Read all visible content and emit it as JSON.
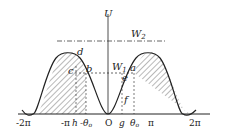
{
  "diagram": {
    "type": "potential-energy-curve",
    "axis": {
      "y_label": "U",
      "origin_label": "O"
    },
    "energy_levels": [
      {
        "name": "W2",
        "label": "W",
        "subscript": "2",
        "style": "dash-dot"
      },
      {
        "name": "W1",
        "label": "W",
        "subscript": "1",
        "style": "dashed"
      }
    ],
    "x_ticks": [
      "-2π",
      "-π",
      "h",
      "-θ₀",
      "O",
      "g",
      "θ₀",
      "π",
      "2π"
    ],
    "points": [
      "a",
      "b",
      "c",
      "d",
      "e",
      "f"
    ],
    "colors": {
      "line": "#222222",
      "hatch": "#333333",
      "background": "#ffffff"
    }
  }
}
